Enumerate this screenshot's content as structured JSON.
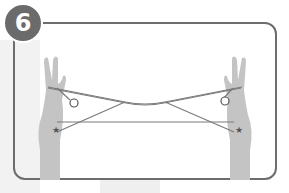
{
  "step": {
    "number": "6"
  },
  "illustration": {
    "subject": "two hands holding string figure",
    "markers": [
      "circle-left",
      "circle-right",
      "star-left",
      "star-right"
    ]
  },
  "colors": {
    "frame": "#6d6d6d",
    "badge": "#6b6b6b",
    "hand": "#bdbdbd",
    "string": "#7a7a7a"
  }
}
